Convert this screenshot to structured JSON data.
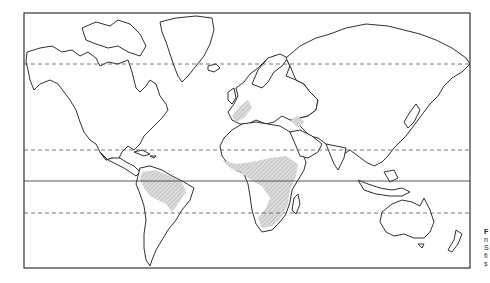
{
  "figure": {
    "type": "world-map",
    "projection": "Mercator",
    "frame": {
      "left": 24,
      "top": 13,
      "right": 470,
      "bottom": 268
    },
    "latitude_lines": [
      {
        "name": "Arctic Circle",
        "y": 64,
        "style": "dashed"
      },
      {
        "name": "Tropic of Cancer",
        "y": 150,
        "style": "dashed"
      },
      {
        "name": "Equator",
        "y": 181,
        "style": "solid"
      },
      {
        "name": "Tropic of Capricorn",
        "y": 213,
        "style": "dashed"
      }
    ],
    "shaded_regions": [
      "Amazon basin (South America)",
      "Sahel and Central/Southern Africa",
      "Western Europe patch",
      "Caspian region patch"
    ],
    "colors": {
      "outline": "#1a1a1a",
      "shading": "#c8c8c8",
      "background": "#ffffff"
    }
  },
  "side_caption": {
    "lines": [
      "F",
      "n",
      "S",
      "fi",
      "s"
    ]
  }
}
